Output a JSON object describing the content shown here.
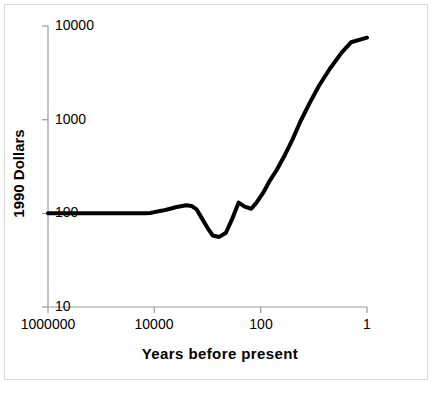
{
  "chart_data": {
    "type": "line",
    "title": "",
    "xlabel": "Years before present",
    "ylabel": "1990 Dollars",
    "xscale": "log",
    "yscale": "log",
    "x_reversed": true,
    "xlim": [
      1000000,
      1
    ],
    "ylim": [
      10,
      10000
    ],
    "grid": false,
    "legend": "none",
    "xticks": [
      "1000000",
      "10000",
      "100",
      "1"
    ],
    "xtick_values": [
      1000000,
      10000,
      100,
      1
    ],
    "yticks": [
      "10000",
      "1000",
      "100",
      "10"
    ],
    "ytick_values": [
      10000,
      1000,
      100,
      10
    ],
    "series": [
      {
        "name": "GDP per capita",
        "x": [
          1000000,
          300000,
          100000,
          30000,
          15000,
          12000,
          10000,
          7000,
          5000,
          4000,
          3000,
          2500,
          2000,
          1600,
          1300,
          1000,
          800,
          600,
          450,
          350,
          260,
          200,
          150,
          120,
          90,
          70,
          50,
          35,
          25,
          18,
          12,
          8,
          5,
          3,
          2,
          1
        ],
        "y": [
          100,
          100,
          100,
          100,
          100,
          101,
          103,
          107,
          112,
          116,
          120,
          122,
          120,
          110,
          90,
          70,
          58,
          56,
          62,
          85,
          130,
          118,
          112,
          130,
          165,
          215,
          290,
          420,
          620,
          950,
          1500,
          2300,
          3500,
          5200,
          6700,
          7500
        ]
      }
    ]
  },
  "line_style": {
    "color": "#000000",
    "width_px": 4
  },
  "axis_style": {
    "color": "#9a9a9a",
    "width_px": 1
  },
  "frame": {
    "border_color": "#d8d8d8",
    "background": "#ffffff"
  }
}
